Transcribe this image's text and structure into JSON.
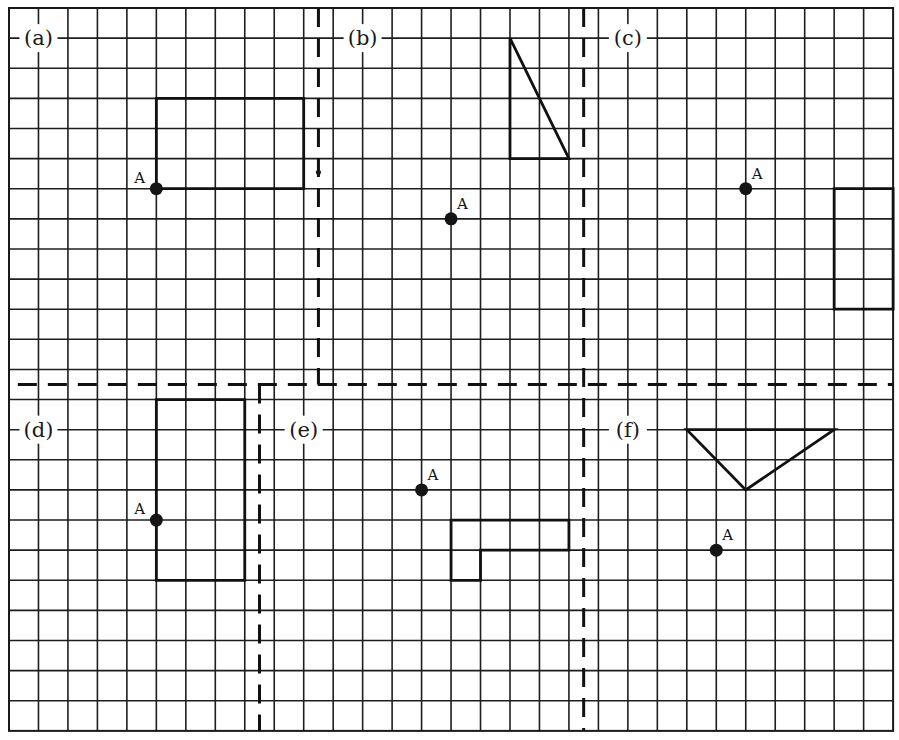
{
  "worksheet": {
    "grid": {
      "columns": 30,
      "rows": 24,
      "origin_px": [
        9,
        8
      ],
      "cell_width_px": 29.47,
      "cell_height_px": 30.12,
      "line_color": "#1e1e1e"
    },
    "dividers": [
      {
        "id": "divider-a-b",
        "orientation": "vertical",
        "at": 10.5,
        "from": 0,
        "to": 12.5
      },
      {
        "id": "divider-b-c",
        "orientation": "vertical",
        "at": 19.5,
        "from": 0,
        "to": 24
      },
      {
        "id": "divider-top-bottom",
        "orientation": "horizontal",
        "at": 12.5,
        "from": 0.3,
        "to": 30
      },
      {
        "id": "divider-d-e",
        "orientation": "vertical",
        "at": 8.5,
        "from": 12.5,
        "to": 24
      }
    ],
    "panels": [
      {
        "id": "a",
        "label": "(a)",
        "label_pos": [
          1,
          1
        ],
        "shape": {
          "type": "polygon",
          "points": [
            [
              5,
              3
            ],
            [
              10,
              3
            ],
            [
              10,
              6
            ],
            [
              5,
              6
            ]
          ]
        },
        "point": {
          "name": "A",
          "pos": [
            5,
            6
          ],
          "label_offset": [
            -0.75,
            -0.35
          ]
        }
      },
      {
        "id": "b",
        "label": "(b)",
        "label_pos": [
          12,
          1
        ],
        "shape": {
          "type": "polygon",
          "points": [
            [
              17,
              1
            ],
            [
              19,
              5
            ],
            [
              17,
              5
            ]
          ]
        },
        "point": {
          "name": "A",
          "pos": [
            15,
            7
          ],
          "label_offset": [
            0.2,
            -0.5
          ]
        }
      },
      {
        "id": "c",
        "label": "(c)",
        "label_pos": [
          21,
          1
        ],
        "shape": {
          "type": "polygon",
          "points": [
            [
              28,
              6
            ],
            [
              30,
              6
            ],
            [
              30,
              10
            ],
            [
              28,
              10
            ]
          ]
        },
        "point": {
          "name": "A",
          "pos": [
            25,
            6
          ],
          "label_offset": [
            0.2,
            -0.5
          ]
        }
      },
      {
        "id": "d",
        "label": "(d)",
        "label_pos": [
          1,
          14
        ],
        "shape": {
          "type": "polygon",
          "points": [
            [
              5,
              13
            ],
            [
              8,
              13
            ],
            [
              8,
              19
            ],
            [
              5,
              19
            ]
          ]
        },
        "point": {
          "name": "A",
          "pos": [
            5,
            17
          ],
          "label_offset": [
            -0.75,
            -0.35
          ]
        }
      },
      {
        "id": "e",
        "label": "(e)",
        "label_pos": [
          10,
          14
        ],
        "shape": {
          "type": "polygon",
          "points": [
            [
              15,
              17
            ],
            [
              19,
              17
            ],
            [
              19,
              18
            ],
            [
              16,
              18
            ],
            [
              16,
              19
            ],
            [
              15,
              19
            ]
          ]
        },
        "point": {
          "name": "A",
          "pos": [
            14,
            16
          ],
          "label_offset": [
            0.2,
            -0.5
          ]
        }
      },
      {
        "id": "f",
        "label": "(f)",
        "label_pos": [
          21,
          14
        ],
        "shape": {
          "type": "polygon",
          "points": [
            [
              23,
              14
            ],
            [
              28,
              14
            ],
            [
              25,
              16
            ]
          ]
        },
        "point": {
          "name": "A",
          "pos": [
            24,
            18
          ],
          "label_offset": [
            0.2,
            -0.5
          ]
        }
      }
    ],
    "artifacts": [
      {
        "type": "dot",
        "pos": [
          10.5,
          5.45
        ],
        "r": 2.5
      }
    ]
  }
}
